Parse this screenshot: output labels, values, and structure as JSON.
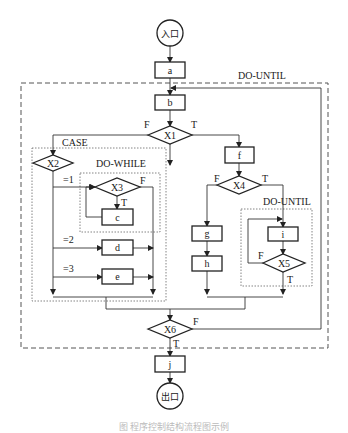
{
  "diagram": {
    "type": "flowchart",
    "entry": "入口",
    "exit": "出口",
    "process_boxes": [
      "a",
      "b",
      "c",
      "d",
      "e",
      "f",
      "g",
      "h",
      "i",
      "j"
    ],
    "decisions": [
      "X1",
      "X2",
      "X3",
      "X4",
      "X5",
      "X6"
    ],
    "regions": {
      "outer_loop": "DO-UNTIL",
      "case": "CASE",
      "do_while": "DO-WHILE",
      "inner_loop": "DO-UNTIL"
    },
    "edge_labels": {
      "x1_false": "F",
      "x1_true": "T",
      "x2_case1": "=1",
      "x2_case2": "=2",
      "x2_case3": "=3",
      "x3_false": "F",
      "x3_true": "T",
      "x4_false": "F",
      "x4_true": "T",
      "x5_false": "F",
      "x5_true": "T",
      "x6_false": "F",
      "x6_true": "T"
    }
  },
  "caption": "图 程序控制结构流程图示例"
}
